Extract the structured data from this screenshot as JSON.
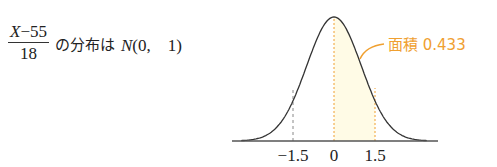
{
  "formula": {
    "numerator_var": "X",
    "numerator_rest": "−55",
    "denominator": "18",
    "text": "の分布は",
    "dist_name": "N",
    "dist_params": "(0,　1)"
  },
  "chart_data": {
    "type": "area",
    "title": "",
    "xlabel": "",
    "ylabel": "",
    "x_ticks": [
      "−1.5",
      "0",
      "1.5"
    ],
    "x_tick_values": [
      -1.5,
      0,
      1.5
    ],
    "shaded_region": {
      "from": 0,
      "to": 1.5,
      "area": 0.433
    },
    "annotation": "面積 0.433",
    "dashed_lines_at": [
      -1.5,
      0,
      1.5
    ],
    "colors": {
      "curve": "#333333",
      "shade": "#fffbe6",
      "annotation": "#f0a030",
      "dashed_left": "#888888",
      "dashed_right": "#f0a030"
    },
    "grid": false
  }
}
